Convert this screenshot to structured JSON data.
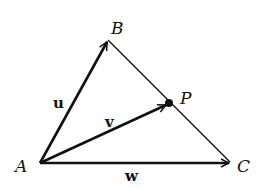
{
  "diagram": {
    "points": {
      "A": {
        "label": "A"
      },
      "B": {
        "label": "B"
      },
      "C": {
        "label": "C"
      },
      "P": {
        "label": "P"
      }
    },
    "vectors": [
      {
        "name": "u",
        "label": "u",
        "from": "A",
        "to": "B"
      },
      {
        "name": "v",
        "label": "v",
        "from": "A",
        "to": "P"
      },
      {
        "name": "w",
        "label": "w",
        "from": "A",
        "to": "C"
      }
    ],
    "segments": [
      {
        "from": "B",
        "to": "C"
      }
    ],
    "colors": {
      "ink": "#111111",
      "background": "#ffffff"
    }
  }
}
